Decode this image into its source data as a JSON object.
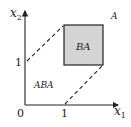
{
  "diagram": {
    "axes": {
      "x_label": "x",
      "x_sub": "1",
      "y_label": "x",
      "y_sub": "2",
      "origin": "0",
      "x_tick": "1",
      "y_tick": "1"
    },
    "regions": {
      "outer": "A",
      "box": "BA",
      "lower_left": "ABA"
    },
    "colors": {
      "box_fill": "#d4d4d4",
      "line": "#222222",
      "background": "#ffffff"
    }
  }
}
